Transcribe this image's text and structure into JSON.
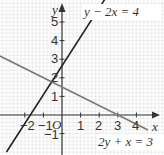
{
  "chart_data": {
    "type": "line",
    "title": "",
    "xlabel": "x",
    "ylabel": "y",
    "origin_label": "O",
    "xlim": [
      -3.4,
      5.3
    ],
    "ylim": [
      -2.1,
      6.1
    ],
    "x_ticks": [
      -2,
      -1,
      1,
      2,
      3,
      4
    ],
    "x_tick_labels": [
      "−2",
      "−1",
      "",
      "2",
      "3",
      "4"
    ],
    "y_ticks": [
      -1,
      1,
      2,
      3,
      4,
      5
    ],
    "y_tick_labels": [
      "−1",
      "1",
      "2",
      "3",
      "4",
      "5"
    ],
    "grid": true,
    "series": [
      {
        "name": "y − 2x = 4",
        "equation": "y = 2x + 4",
        "color": "#222222",
        "points": [
          [
            -3.0,
            -2.0
          ],
          [
            1.0,
            6.0
          ]
        ]
      },
      {
        "name": "2y + x = 3",
        "equation": "y = (3 − x)/2",
        "color": "#777777",
        "points": [
          [
            -3.4,
            3.2
          ],
          [
            4.6,
            -0.8
          ]
        ]
      }
    ],
    "annotations": [
      {
        "text": "y − 2x = 4",
        "position": "top-right"
      },
      {
        "text": "2y + x = 3",
        "position": "bottom-right"
      }
    ]
  },
  "labels": {
    "eq1": "y − 2x = 4",
    "eq2": "2y + x = 3",
    "x_axis": "x",
    "y_axis": "y",
    "origin": "O",
    "x_ticks": [
      "−2",
      "−1",
      "1",
      "2",
      "3",
      "4"
    ],
    "y_ticks": [
      "5",
      "4",
      "3",
      "2",
      "1",
      "−1"
    ]
  },
  "colors": {
    "grid": "#d9d9d9",
    "axis": "#333333",
    "line1": "#222222",
    "line2": "#808080"
  }
}
